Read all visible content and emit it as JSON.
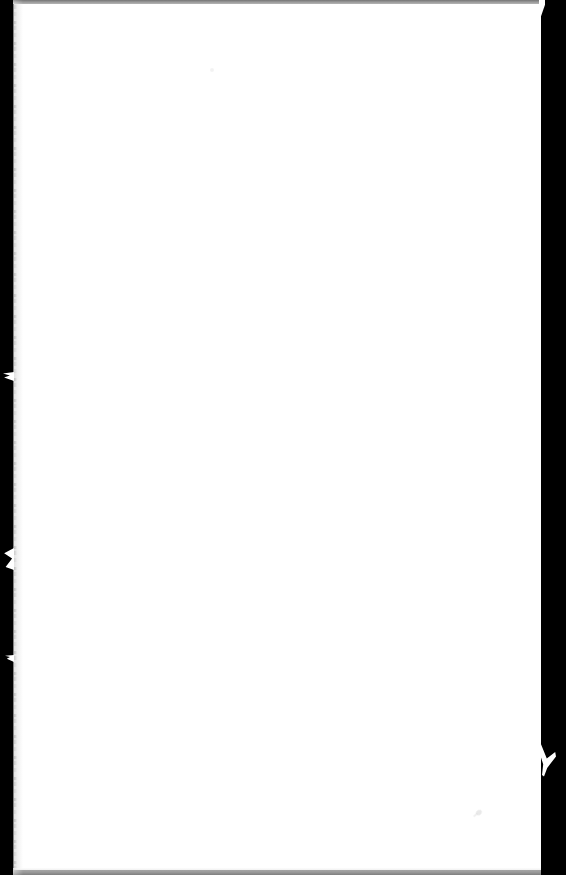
{
  "document": {
    "kind": "scanned-page-image",
    "page_background_color": "#ffffff",
    "scan_bed_color": "#000000",
    "body_text": "",
    "width_px": 566,
    "height_px": 875
  },
  "borders": {
    "left": {
      "name": "left-scan-border",
      "color": "#000000",
      "width_px": 14,
      "edge": "ragged"
    },
    "right": {
      "name": "right-scan-border",
      "color": "#000000",
      "width_px": 25,
      "edge": "straight"
    },
    "top": {
      "name": "top-scan-edge",
      "color": "#9a9a9a",
      "height_px": 4,
      "edge": "soft-gradient"
    },
    "bottom": {
      "name": "bottom-scan-edge",
      "color": "#b5b5b5",
      "height_px": 7,
      "edge": "soft-gradient"
    }
  },
  "defects": [
    {
      "name": "left-edge-notch-upper",
      "shape": "wedge",
      "color": "#ffffff"
    },
    {
      "name": "left-edge-notch-middle",
      "shape": "wedge",
      "color": "#ffffff"
    },
    {
      "name": "left-edge-notch-lower",
      "shape": "wedge",
      "color": "#ffffff"
    },
    {
      "name": "right-edge-tick-notch",
      "shape": "check-mark",
      "color": "#ffffff"
    },
    {
      "name": "right-edge-notch-top",
      "shape": "wedge",
      "color": "#ffffff"
    },
    {
      "name": "paper-speck-upper",
      "shape": "dot",
      "color": "#c9c9c9"
    },
    {
      "name": "paper-speck-lower",
      "shape": "smudge",
      "color": "#c9c9c9"
    }
  ]
}
